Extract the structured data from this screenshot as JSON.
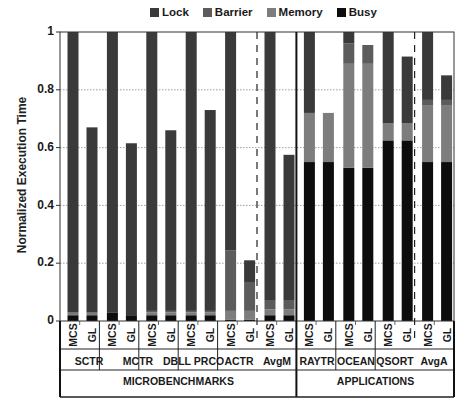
{
  "chart_data": {
    "type": "bar",
    "stacked": true,
    "title": "",
    "xlabel": "",
    "ylabel": "Normalized Execution Time",
    "ylim": [
      0,
      1
    ],
    "yticks": [
      "0",
      "0.2",
      "0.4",
      "0.6",
      "0.8",
      "1"
    ],
    "grid": "horizontal dotted",
    "legend": {
      "position": "top",
      "entries": [
        "Lock",
        "Barrier",
        "Memory",
        "Busy"
      ]
    },
    "colors": {
      "Lock": "#3a3a3a",
      "Barrier": "#5c5c5c",
      "Memory": "#7d7d7d",
      "Busy": "#0d0d0d"
    },
    "groups": [
      {
        "name": "MICROBENCHMARKS",
        "benchmarks": [
          "SCTR",
          "MCTR",
          "DBLL",
          "PRCO",
          "ACTR",
          "AvgM"
        ]
      },
      {
        "name": "APPLICATIONS",
        "benchmarks": [
          "RAYTR",
          "OCEAN",
          "QSORT",
          "AvgA"
        ]
      }
    ],
    "bars": [
      {
        "benchmark": "SCTR",
        "config": "MCS",
        "Busy": 0.02,
        "Memory": 0.005,
        "Barrier": 0.005,
        "Lock": 0.97
      },
      {
        "benchmark": "SCTR",
        "config": "GL",
        "Busy": 0.02,
        "Memory": 0.005,
        "Barrier": 0.005,
        "Lock": 0.64
      },
      {
        "benchmark": "MCTR",
        "config": "MCS",
        "Busy": 0.03,
        "Memory": 0.0,
        "Barrier": 0.0,
        "Lock": 0.97
      },
      {
        "benchmark": "MCTR",
        "config": "GL",
        "Busy": 0.02,
        "Memory": 0.0,
        "Barrier": 0.0,
        "Lock": 0.595
      },
      {
        "benchmark": "DBLL",
        "config": "MCS",
        "Busy": 0.02,
        "Memory": 0.01,
        "Barrier": 0.005,
        "Lock": 0.965
      },
      {
        "benchmark": "DBLL",
        "config": "GL",
        "Busy": 0.02,
        "Memory": 0.01,
        "Barrier": 0.005,
        "Lock": 0.625
      },
      {
        "benchmark": "PRCO",
        "config": "MCS",
        "Busy": 0.02,
        "Memory": 0.01,
        "Barrier": 0.005,
        "Lock": 0.965
      },
      {
        "benchmark": "PRCO",
        "config": "GL",
        "Busy": 0.02,
        "Memory": 0.01,
        "Barrier": 0.005,
        "Lock": 0.695
      },
      {
        "benchmark": "ACTR",
        "config": "MCS",
        "Busy": 0.005,
        "Memory": 0.03,
        "Barrier": 0.21,
        "Lock": 0.755
      },
      {
        "benchmark": "ACTR",
        "config": "GL",
        "Busy": 0.005,
        "Memory": 0.03,
        "Barrier": 0.1,
        "Lock": 0.075
      },
      {
        "benchmark": "AvgM",
        "config": "MCS",
        "Busy": 0.02,
        "Memory": 0.02,
        "Barrier": 0.03,
        "Lock": 0.93
      },
      {
        "benchmark": "AvgM",
        "config": "GL",
        "Busy": 0.02,
        "Memory": 0.02,
        "Barrier": 0.03,
        "Lock": 0.505
      },
      {
        "benchmark": "RAYTR",
        "config": "MCS",
        "Busy": 0.55,
        "Memory": 0.17,
        "Barrier": 0.0,
        "Lock": 0.28
      },
      {
        "benchmark": "RAYTR",
        "config": "GL",
        "Busy": 0.55,
        "Memory": 0.17,
        "Barrier": 0.0,
        "Lock": 0.0
      },
      {
        "benchmark": "OCEAN",
        "config": "MCS",
        "Busy": 0.53,
        "Memory": 0.36,
        "Barrier": 0.07,
        "Lock": 0.04
      },
      {
        "benchmark": "OCEAN",
        "config": "GL",
        "Busy": 0.53,
        "Memory": 0.36,
        "Barrier": 0.065,
        "Lock": 0.0
      },
      {
        "benchmark": "QSORT",
        "config": "MCS",
        "Busy": 0.625,
        "Memory": 0.06,
        "Barrier": 0.0,
        "Lock": 0.315
      },
      {
        "benchmark": "QSORT",
        "config": "GL",
        "Busy": 0.625,
        "Memory": 0.06,
        "Barrier": 0.0,
        "Lock": 0.23
      },
      {
        "benchmark": "AvgA",
        "config": "MCS",
        "Busy": 0.55,
        "Memory": 0.195,
        "Barrier": 0.02,
        "Lock": 0.235
      },
      {
        "benchmark": "AvgA",
        "config": "GL",
        "Busy": 0.55,
        "Memory": 0.195,
        "Barrier": 0.02,
        "Lock": 0.085
      }
    ],
    "totals": {
      "SCTR": {
        "MCS": 1.0,
        "GL": 0.67
      },
      "MCTR": {
        "MCS": 1.0,
        "GL": 0.615
      },
      "DBLL": {
        "MCS": 1.0,
        "GL": 0.66
      },
      "PRCO": {
        "MCS": 1.0,
        "GL": 0.73
      },
      "ACTR": {
        "MCS": 1.0,
        "GL": 0.21
      },
      "AvgM": {
        "MCS": 1.0,
        "GL": 0.575
      },
      "RAYTR": {
        "MCS": 1.0,
        "GL": 0.72
      },
      "OCEAN": {
        "MCS": 1.0,
        "GL": 0.955
      },
      "QSORT": {
        "MCS": 1.0,
        "GL": 0.915
      },
      "AvgA": {
        "MCS": 1.0,
        "GL": 0.85
      }
    }
  },
  "legend": {
    "lock": "Lock",
    "barrier": "Barrier",
    "memory": "Memory",
    "busy": "Busy"
  },
  "axis": {
    "ylabel": "Normalized Execution Time",
    "ticks": {
      "t0": "0",
      "t02": "0.2",
      "t04": "0.4",
      "t06": "0.6",
      "t08": "0.8",
      "t1": "1"
    }
  },
  "xaxis": {
    "config_labels": {
      "mcs": "MCS",
      "gl": "GL"
    },
    "benchmarks": {
      "b0": "SCTR",
      "b1": "MCTR",
      "b2": "DBLL",
      "b3": "PRCO",
      "b4": "ACTR",
      "b5": "AvgM",
      "b6": "RAYTR",
      "b7": "OCEAN",
      "b8": "QSORT",
      "b9": "AvgA"
    },
    "groups": {
      "g0": "MICROBENCHMARKS",
      "g1": "APPLICATIONS"
    }
  }
}
